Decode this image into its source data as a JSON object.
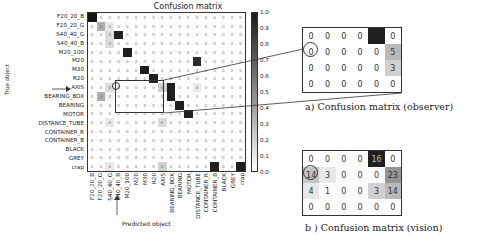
{
  "figure": {
    "main_title": "Confusion matrix",
    "y_axis_title": "True object",
    "x_axis_title": "Predicted object",
    "caption_a": "a) Confusion matrix (observer)",
    "caption_b": "b ) Confusion matrix (vision)"
  },
  "chart_data": [
    {
      "type": "heatmap",
      "title": "Confusion matrix",
      "xlabel": "Predicted object",
      "ylabel": "True object",
      "classes": [
        "F20_20_B",
        "F20_20_G",
        "S40_40_G",
        "S40_40_B",
        "M20_100",
        "M20",
        "M30",
        "R20",
        "AXIS",
        "BEARING_BOX",
        "BEARING",
        "MOTOR",
        "DISTANCE_TUBE",
        "CONTAINER_R",
        "CONTAINER_B",
        "BLACK",
        "GREY",
        "crap"
      ],
      "rows": [
        "F20_20_B",
        "F20_20_G",
        "S40_40_G",
        "S40_40_B",
        "M20_100",
        "M20",
        "M30",
        "R20",
        "AXIS",
        "BEARING_BOX",
        "BEARING",
        "MOTOR",
        "DISTANCE_TUBE",
        "CONTAINER_R",
        "CONTAINER_B",
        "BLACK",
        "GREY",
        "crap"
      ],
      "columns": [
        "F20_20_B",
        "F20_20_G",
        "S40_40_G",
        "S40_40_B",
        "M20_100",
        "M20",
        "M30",
        "R20",
        "AXIS",
        "BEARING_BOX",
        "BEARING",
        "MOTOR",
        "DISTANCE_TUBE",
        "CONTAINER_R",
        "CONTAINER_B",
        "BLACK",
        "GREY",
        "crap"
      ],
      "colorbar": {
        "min": 0.0,
        "max": 1.0,
        "ticks": [
          "1.0",
          "0.9",
          "0.8",
          "0.7",
          "0.6",
          "0.5",
          "0.4",
          "0.3",
          "0.2",
          "0.1",
          "0.0"
        ]
      },
      "highlight": {
        "arrow_row": "AXIS",
        "arrow_col": "S40_40_B",
        "circled_cell": [
          "AXIS",
          "S40_40_B"
        ]
      },
      "intensity_notes": "Dark diagonal cells (~1.0) for most classes; M20 row strongly predicted as DISTANCE_TUBE; BEARING_BOX partially as F20_20_G; crap predicted as CONTAINER_B and crap; row M20/M30/R20 and AXIS light off-diagonal values."
    },
    {
      "type": "table",
      "title": "a) Confusion matrix (observer)",
      "values": [
        [
          0,
          0,
          0,
          0,
          null,
          0
        ],
        [
          0,
          0,
          0,
          0,
          0,
          5
        ],
        [
          0,
          0,
          0,
          0,
          0,
          3
        ],
        [
          0,
          0,
          0,
          0,
          0,
          0
        ]
      ],
      "circled": [
        1,
        0
      ],
      "dark_cell": [
        0,
        4
      ]
    },
    {
      "type": "table",
      "title": "b ) Confusion matrix (vision)",
      "values": [
        [
          0,
          0,
          0,
          0,
          16,
          0
        ],
        [
          14,
          3,
          0,
          0,
          0,
          23
        ],
        [
          4,
          1,
          0,
          0,
          3,
          14
        ],
        [
          0,
          0,
          0,
          0,
          0,
          0
        ]
      ],
      "circled": [
        1,
        0
      ],
      "dark_cell": [
        0,
        4
      ]
    }
  ],
  "main_matrix": {
    "row_labels": [
      "F20_20_B",
      "F20_20_G",
      "S40_40_G",
      "S40_40_B",
      "M20_100",
      "M20",
      "M30",
      "R20",
      "AXIS",
      "BEARING_BOX",
      "BEARING",
      "MOTOR",
      "DISTANCE_TUBE",
      "CONTAINER_R",
      "CONTAINER_B",
      "BLACK",
      "GREY",
      "crap"
    ],
    "col_labels": [
      "F20_20_B",
      "F20_20_G",
      "S40_40_G",
      "S40_40_B",
      "M20_100",
      "M20",
      "M30",
      "R20",
      "AXIS",
      "BEARING_BOX",
      "BEARING",
      "MOTOR",
      "DISTANCE_TUBE",
      "CONTAINER_R",
      "CONTAINER_B",
      "BLACK",
      "GREY",
      "crap"
    ],
    "shade": [
      [
        1,
        0,
        0,
        0,
        0,
        0,
        0,
        0,
        0,
        0,
        0,
        0,
        0,
        0,
        0,
        0,
        0,
        0
      ],
      [
        0,
        0.35,
        0.1,
        0,
        0,
        0,
        0,
        0,
        0,
        0,
        0,
        0,
        0,
        0,
        0,
        0,
        0,
        0
      ],
      [
        0,
        0,
        0.15,
        0.95,
        0,
        0,
        0,
        0,
        0,
        0,
        0,
        0,
        0,
        0,
        0,
        0,
        0,
        0
      ],
      [
        0,
        0,
        0.15,
        0,
        0,
        0,
        0,
        0,
        0,
        0,
        0,
        0,
        0,
        0,
        0,
        0,
        0,
        0
      ],
      [
        0,
        0,
        0,
        0,
        0.95,
        0,
        0,
        0,
        0,
        0,
        0,
        0,
        0,
        0,
        0,
        0,
        0,
        0
      ],
      [
        0,
        0,
        0,
        0,
        0,
        0,
        0,
        0,
        0,
        0,
        0,
        0,
        0.9,
        0,
        0,
        0,
        0,
        0
      ],
      [
        0,
        0,
        0,
        0,
        0,
        0,
        0.95,
        0,
        0,
        0,
        0,
        0,
        0,
        0,
        0,
        0,
        0,
        0
      ],
      [
        0,
        0,
        0,
        0,
        0,
        0,
        0,
        0.95,
        0,
        0,
        0,
        0,
        0,
        0,
        0,
        0,
        0,
        0
      ],
      [
        0,
        0,
        0.15,
        0,
        0,
        0,
        0,
        0,
        0.2,
        0.95,
        0,
        0,
        0.1,
        0,
        0,
        0,
        0,
        0
      ],
      [
        0,
        0.35,
        0.05,
        0,
        0,
        0,
        0,
        0,
        0,
        0.95,
        0,
        0,
        0,
        0,
        0,
        0,
        0,
        0
      ],
      [
        0,
        0,
        0,
        0,
        0,
        0,
        0,
        0,
        0,
        0,
        0.95,
        0,
        0,
        0,
        0,
        0,
        0,
        0
      ],
      [
        0,
        0,
        0,
        0,
        0,
        0,
        0,
        0,
        0,
        0,
        0,
        0.95,
        0,
        0,
        0,
        0,
        0,
        0
      ],
      [
        0,
        0,
        0.1,
        0,
        0,
        0,
        0,
        0,
        0.15,
        0,
        0,
        0,
        0,
        0,
        0,
        0,
        0,
        0
      ],
      [
        0,
        0,
        0,
        0,
        0,
        0,
        0,
        0,
        0,
        0,
        0,
        0,
        0,
        0,
        0,
        0,
        0,
        0
      ],
      [
        0,
        0,
        0,
        0,
        0,
        0,
        0,
        0,
        0,
        0,
        0,
        0,
        0,
        0,
        0,
        0,
        0,
        0
      ],
      [
        0,
        0,
        0,
        0,
        0,
        0,
        0,
        0,
        0,
        0,
        0,
        0,
        0,
        0,
        0,
        0,
        0,
        0
      ],
      [
        0,
        0,
        0,
        0,
        0,
        0,
        0,
        0,
        0,
        0,
        0,
        0,
        0,
        0,
        0,
        0,
        0,
        0
      ],
      [
        0,
        0,
        0.1,
        0,
        0,
        0,
        0,
        0,
        0.2,
        0,
        0,
        0,
        0,
        0,
        0.95,
        0,
        0,
        0.95
      ]
    ]
  },
  "colorbar_ticks": [
    "1.0",
    "0.9",
    "0.8",
    "0.7",
    "0.6",
    "0.5",
    "0.4",
    "0.3",
    "0.2",
    "0.1",
    "0.0"
  ],
  "inset_a": [
    [
      "0",
      "0",
      "0",
      "0",
      "",
      "0"
    ],
    [
      "0",
      "0",
      "0",
      "0",
      "0",
      "5"
    ],
    [
      "0",
      "0",
      "0",
      "0",
      "0",
      "3"
    ],
    [
      "0",
      "0",
      "0",
      "0",
      "0",
      "0"
    ]
  ],
  "inset_b": [
    [
      "0",
      "0",
      "0",
      "0",
      "16",
      "0"
    ],
    [
      "14",
      "3",
      "0",
      "0",
      "0",
      "23"
    ],
    [
      "4",
      "1",
      "0",
      "0",
      "3",
      "14"
    ],
    [
      "0",
      "0",
      "0",
      "0",
      "0",
      "0"
    ]
  ],
  "inset_a_shade": [
    [
      0,
      0,
      0,
      0,
      0.95,
      0
    ],
    [
      0,
      0,
      0,
      0,
      0,
      0.3
    ],
    [
      0,
      0,
      0,
      0,
      0,
      0.2
    ],
    [
      0,
      0,
      0,
      0,
      0,
      0
    ]
  ],
  "inset_b_shade": [
    [
      0,
      0,
      0,
      0,
      0.95,
      0
    ],
    [
      0.25,
      0.1,
      0,
      0,
      0,
      0.45
    ],
    [
      0.1,
      0,
      0,
      0,
      0.2,
      0.3
    ],
    [
      0,
      0,
      0,
      0,
      0,
      0
    ]
  ]
}
